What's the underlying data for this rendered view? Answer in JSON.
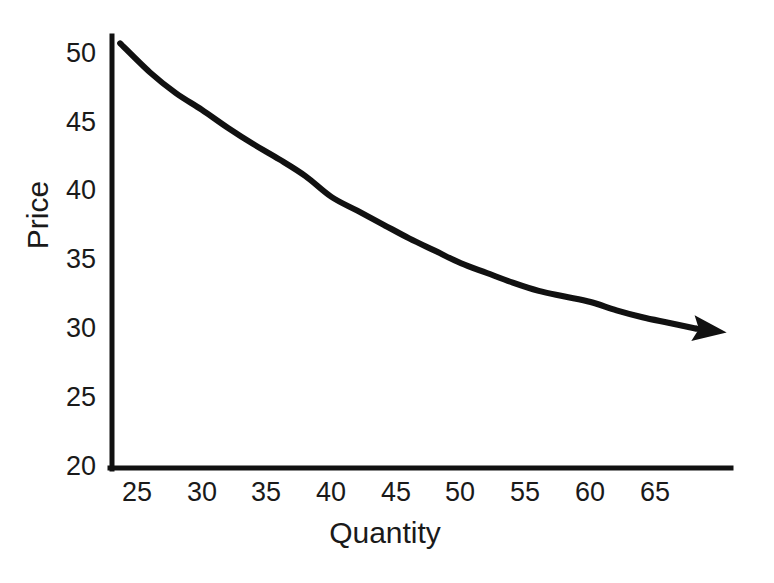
{
  "chart_data": {
    "type": "line",
    "title": "",
    "subtitle": "",
    "xlabel": "Quantity",
    "ylabel": "Price",
    "xlim": [
      23.5,
      71.0
    ],
    "ylim": [
      20,
      51
    ],
    "xticks": [
      25,
      30,
      35,
      40,
      45,
      50,
      55,
      60,
      65
    ],
    "yticks": [
      20,
      25,
      30,
      35,
      40,
      45,
      50
    ],
    "xtick_labels": [
      "25",
      "30",
      "35",
      "40",
      "45",
      "50",
      "55",
      "60",
      "65"
    ],
    "ytick_labels": [
      "20",
      "25",
      "30",
      "35",
      "40",
      "45",
      "50"
    ],
    "grid": false,
    "legend": null,
    "legend_position": "none",
    "series": [
      {
        "name": "Demand",
        "style": "solid",
        "color": "#111111",
        "line_width": 6,
        "arrow_end": true,
        "x": [
          23.7,
          26,
          28,
          30,
          32,
          34,
          36,
          38,
          40,
          42,
          44,
          46,
          48,
          50,
          52,
          54,
          56,
          58,
          60,
          62,
          64,
          66,
          68,
          70.5
        ],
        "y": [
          50.7,
          48.6,
          47.1,
          45.9,
          44.6,
          43.4,
          42.3,
          41.1,
          39.6,
          38.6,
          37.6,
          36.6,
          35.7,
          34.8,
          34.1,
          33.4,
          32.8,
          32.4,
          32.0,
          31.4,
          30.9,
          30.5,
          30.1,
          29.8
        ]
      }
    ],
    "annotations": []
  },
  "axes": {
    "y_title": "Price",
    "x_title": "Quantity",
    "y_tick_labels": [
      "50",
      "45",
      "40",
      "35",
      "30",
      "25",
      "20"
    ],
    "x_tick_labels": [
      "25",
      "30",
      "35",
      "40",
      "45",
      "50",
      "55",
      "60",
      "65"
    ],
    "axis_color": "#111111",
    "background_color": "#ffffff"
  }
}
